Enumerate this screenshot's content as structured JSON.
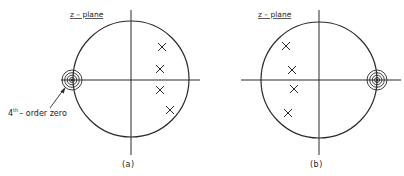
{
  "figure": {
    "panels": [
      {
        "id": "a",
        "title": "z – plane",
        "caption": "(a)",
        "annotation": {
          "base": "4",
          "sup": "th",
          "rest": "– order zero"
        },
        "unit_circle": {
          "cx": 131,
          "cy": 79,
          "r": 58
        },
        "zero": {
          "order": 4,
          "x": 73,
          "y": 80,
          "location": "z = -1"
        },
        "poles": [
          {
            "x": 162,
            "y": 47
          },
          {
            "x": 160,
            "y": 69
          },
          {
            "x": 160,
            "y": 90
          },
          {
            "x": 170,
            "y": 110
          }
        ]
      },
      {
        "id": "b",
        "title": "z – plane",
        "caption": "(b)",
        "unit_circle": {
          "cx": 319,
          "cy": 80,
          "r": 58
        },
        "zero": {
          "order": 4,
          "x": 377,
          "y": 80,
          "location": "z = 1"
        },
        "poles": [
          {
            "x": 286,
            "y": 46
          },
          {
            "x": 292,
            "y": 70
          },
          {
            "x": 294,
            "y": 89
          },
          {
            "x": 288,
            "y": 113
          }
        ]
      }
    ],
    "colors": {
      "line": "#2a2a2a",
      "text": "#222222",
      "background": "#ffffff"
    }
  }
}
